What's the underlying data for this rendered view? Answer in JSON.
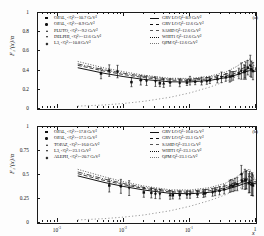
{
  "figure": {
    "xlabel": "x",
    "panel_a_label": "(a)",
    "panel_b_label": "(b)"
  },
  "panel_a": {
    "ylabel": "F₂ʳ(x)/α",
    "yticks": [
      "1",
      "0.8",
      "0.6",
      "0.4",
      "0.2",
      "0"
    ],
    "ylim": [
      0,
      1
    ],
    "xticks": [
      "10",
      "10",
      "10",
      "1"
    ],
    "xtick_exponents": [
      "-3",
      "-2",
      "-1",
      ""
    ],
    "legend_left": [
      {
        "marker": "square",
        "label": "OPAL, <Q²>=10.7 GeV²"
      },
      {
        "marker": "circle",
        "label": "OPAL, <Q²>=8.9 GeV²"
      },
      {
        "marker": "triangle-up",
        "label": "PLUTO, <Q²>=9.2 GeV²"
      },
      {
        "marker": "triangle-down",
        "label": "DELPHI, <Q²>=12.6 GeV²"
      },
      {
        "marker": "diamond",
        "label": "L3, <Q²>=10.8 GeV²"
      }
    ],
    "legend_right": [
      {
        "line": "solid",
        "label": "GRV LO Q²=8.9 GeV²"
      },
      {
        "line": "dash",
        "label": "GRV LO Q²=12.6 GeV²"
      },
      {
        "line": "dashdot",
        "label": "SASID Q²=12.6 GeV²"
      },
      {
        "line": "dot",
        "label": "WHIT1 Q²=12.6 GeV²"
      },
      {
        "line": "longdot",
        "label": "QPM Q²=12.6 GeV²"
      }
    ]
  },
  "panel_b": {
    "ylabel": "F₂ʳ(x)/α",
    "yticks": [
      "1",
      "0.75",
      "0.5",
      "0.25",
      "0"
    ],
    "ylim": [
      0,
      1.1
    ],
    "xticks": [
      "10",
      "10",
      "10",
      "1"
    ],
    "xtick_exponents": [
      "-3",
      "-2",
      "-1",
      ""
    ],
    "legend_left": [
      {
        "marker": "square",
        "label": "OPAL, <Q²>=17.8 GeV²"
      },
      {
        "marker": "circle",
        "label": "OPAL, <Q²>=17.5 GeV²"
      },
      {
        "marker": "triangle-up",
        "label": "TOPAZ, <Q²>=16.0 GeV²"
      },
      {
        "marker": "triangle-down",
        "label": "L3, <Q²>=23.1 GeV²"
      },
      {
        "marker": "diamond",
        "label": "ALEPH, <Q²>=20.7 GeV²"
      }
    ],
    "legend_right": [
      {
        "line": "solid",
        "label": "GRV LO Q²=16.0 GeV²"
      },
      {
        "line": "dash",
        "label": "GRV LO Q²=23.1 GeV²"
      },
      {
        "line": "dashdot",
        "label": "SASID Q²=23.1 GeV²"
      },
      {
        "line": "dot",
        "label": "WHIT1 Q²=23.1 GeV²"
      },
      {
        "line": "longdot",
        "label": "QPM Q²=23.1 GeV²"
      }
    ]
  },
  "chart_data": [
    {
      "type": "scatter",
      "panel": "(a)",
      "title": "Photon structure function F2gamma/alpha, low Q2 sample",
      "xlabel": "x",
      "ylabel": "F2^gamma(x)/alpha",
      "xscale": "log",
      "xlim": [
        0.0005,
        1.0
      ],
      "ylim": [
        0.0,
        1.0
      ],
      "yticks": [
        0,
        0.2,
        0.4,
        0.6,
        0.8,
        1.0
      ],
      "grid": false,
      "legend_position": "top",
      "series": [
        {
          "name": "OPAL, <Q2>=10.7 GeV2",
          "marker": "square",
          "x": [
            0.0045,
            0.013,
            0.035,
            0.09,
            0.2,
            0.35,
            0.55,
            0.75,
            0.9
          ],
          "y": [
            0.37,
            0.28,
            0.268,
            0.275,
            0.3,
            0.33,
            0.37,
            0.43,
            0.395
          ],
          "yerr": [
            0.055,
            0.048,
            0.035,
            0.03,
            0.035,
            0.04,
            0.055,
            0.075,
            0.09
          ]
        },
        {
          "name": "OPAL, <Q2>=8.9 GeV2",
          "marker": "circle",
          "x": [
            0.006,
            0.018,
            0.05,
            0.12,
            0.26,
            0.45,
            0.68,
            0.85
          ],
          "y": [
            0.4,
            0.3,
            0.276,
            0.285,
            0.31,
            0.345,
            0.39,
            0.415
          ],
          "yerr": [
            0.06,
            0.05,
            0.038,
            0.032,
            0.038,
            0.045,
            0.065,
            0.085
          ]
        },
        {
          "name": "PLUTO, <Q2>=9.2 GeV2",
          "marker": "triangle-up",
          "x": [
            0.04,
            0.15,
            0.4,
            0.7
          ],
          "y": [
            0.27,
            0.29,
            0.34,
            0.4
          ],
          "yerr": [
            0.045,
            0.04,
            0.06,
            0.09
          ]
        },
        {
          "name": "DELPHI, <Q2>=12.6 GeV2",
          "marker": "triangle-down",
          "x": [
            0.03,
            0.1,
            0.3,
            0.6,
            0.82
          ],
          "y": [
            0.285,
            0.295,
            0.33,
            0.395,
            0.45
          ],
          "yerr": [
            0.05,
            0.045,
            0.055,
            0.085,
            0.11
          ]
        },
        {
          "name": "L3, <Q2>=10.8 GeV2",
          "marker": "diamond",
          "x": [
            0.008,
            0.022,
            0.07,
            0.18,
            0.42,
            0.66
          ],
          "y": [
            0.39,
            0.295,
            0.272,
            0.292,
            0.34,
            0.385
          ],
          "yerr": [
            0.065,
            0.05,
            0.04,
            0.035,
            0.05,
            0.075
          ]
        }
      ],
      "curves": [
        {
          "name": "GRV LO Q2=8.9 GeV2",
          "line": "solid",
          "x": [
            0.002,
            0.005,
            0.01,
            0.02,
            0.05,
            0.1,
            0.2,
            0.35,
            0.5,
            0.65,
            0.8,
            0.92,
            1.0
          ],
          "y": [
            0.43,
            0.372,
            0.337,
            0.308,
            0.283,
            0.282,
            0.298,
            0.327,
            0.355,
            0.382,
            0.4,
            0.392,
            0.395
          ]
        },
        {
          "name": "GRV LO Q2=12.6 GeV2",
          "line": "dash",
          "x": [
            0.002,
            0.005,
            0.01,
            0.02,
            0.05,
            0.1,
            0.2,
            0.35,
            0.5,
            0.65,
            0.8,
            0.92,
            1.0
          ],
          "y": [
            0.455,
            0.395,
            0.358,
            0.327,
            0.3,
            0.298,
            0.315,
            0.345,
            0.375,
            0.403,
            0.423,
            0.412,
            0.412
          ]
        },
        {
          "name": "SASID Q2=12.6 GeV2",
          "line": "dashdot",
          "x": [
            0.002,
            0.005,
            0.01,
            0.02,
            0.05,
            0.1,
            0.2,
            0.35,
            0.5,
            0.65,
            0.8,
            0.92,
            1.0
          ],
          "y": [
            0.47,
            0.408,
            0.372,
            0.34,
            0.312,
            0.31,
            0.33,
            0.362,
            0.395,
            0.428,
            0.455,
            0.43,
            0.42
          ]
        },
        {
          "name": "WHIT1 Q2=12.6 GeV2",
          "line": "dot",
          "x": [
            0.002,
            0.005,
            0.01,
            0.02,
            0.05,
            0.1,
            0.2,
            0.35,
            0.5,
            0.65,
            0.8,
            0.92,
            1.0
          ],
          "y": [
            0.495,
            0.428,
            0.388,
            0.352,
            0.32,
            0.318,
            0.342,
            0.385,
            0.44,
            0.49,
            0.52,
            0.455,
            0.425
          ]
        },
        {
          "name": "QPM Q2=12.6 GeV2",
          "line": "longdot",
          "x": [
            0.002,
            0.005,
            0.01,
            0.02,
            0.05,
            0.1,
            0.2,
            0.35,
            0.5,
            0.65,
            0.8,
            0.92,
            1.0
          ],
          "y": [
            0.03,
            0.042,
            0.058,
            0.08,
            0.122,
            0.168,
            0.228,
            0.288,
            0.335,
            0.375,
            0.408,
            0.42,
            0.4
          ]
        }
      ]
    },
    {
      "type": "scatter",
      "panel": "(b)",
      "title": "Photon structure function F2gamma/alpha, high Q2 sample",
      "xlabel": "x",
      "ylabel": "F2^gamma(x)/alpha",
      "xscale": "log",
      "xlim": [
        0.0005,
        1.0
      ],
      "ylim": [
        0.0,
        1.1
      ],
      "yticks": [
        0,
        0.25,
        0.5,
        0.75,
        1.0
      ],
      "grid": false,
      "legend_position": "top",
      "series": [
        {
          "name": "OPAL, <Q2>=17.8 GeV2",
          "marker": "square",
          "x": [
            0.006,
            0.02,
            0.055,
            0.13,
            0.28,
            0.45,
            0.62,
            0.78,
            0.9
          ],
          "y": [
            0.43,
            0.35,
            0.318,
            0.33,
            0.37,
            0.425,
            0.48,
            0.455,
            0.43
          ],
          "yerr": [
            0.075,
            0.055,
            0.042,
            0.038,
            0.048,
            0.065,
            0.09,
            0.11,
            0.12
          ]
        },
        {
          "name": "OPAL, <Q2>=17.5 GeV2",
          "marker": "circle",
          "x": [
            0.009,
            0.026,
            0.07,
            0.17,
            0.33,
            0.52,
            0.7,
            0.85
          ],
          "y": [
            0.42,
            0.345,
            0.32,
            0.34,
            0.385,
            0.445,
            0.49,
            0.44
          ],
          "yerr": [
            0.08,
            0.058,
            0.045,
            0.04,
            0.052,
            0.075,
            0.1,
            0.125
          ]
        },
        {
          "name": "TOPAZ, <Q2>=16.0 GeV2",
          "marker": "triangle-up",
          "x": [
            0.05,
            0.16,
            0.4,
            0.68
          ],
          "y": [
            0.322,
            0.338,
            0.42,
            0.5
          ],
          "yerr": [
            0.05,
            0.045,
            0.07,
            0.115
          ]
        },
        {
          "name": "L3, <Q2>=23.1 GeV2",
          "marker": "triangle-down",
          "x": [
            0.012,
            0.035,
            0.1,
            0.24,
            0.48,
            0.72,
            0.88
          ],
          "y": [
            0.4,
            0.332,
            0.325,
            0.358,
            0.44,
            0.495,
            0.445
          ],
          "yerr": [
            0.085,
            0.055,
            0.042,
            0.045,
            0.07,
            0.105,
            0.13
          ]
        },
        {
          "name": "ALEPH, <Q2>=20.7 GeV2",
          "marker": "diamond",
          "x": [
            0.03,
            0.09,
            0.22,
            0.42,
            0.6,
            0.8
          ],
          "y": [
            0.335,
            0.326,
            0.352,
            0.43,
            0.56,
            0.47
          ],
          "yerr": [
            0.055,
            0.042,
            0.045,
            0.068,
            0.1,
            0.12
          ]
        }
      ],
      "curves": [
        {
          "name": "GRV LO Q2=16.0 GeV2",
          "line": "solid",
          "x": [
            0.002,
            0.005,
            0.01,
            0.02,
            0.05,
            0.1,
            0.2,
            0.35,
            0.5,
            0.65,
            0.8,
            0.92,
            1.0
          ],
          "y": [
            0.54,
            0.465,
            0.418,
            0.378,
            0.34,
            0.335,
            0.352,
            0.385,
            0.418,
            0.448,
            0.468,
            0.452,
            0.45
          ]
        },
        {
          "name": "GRV LO Q2=23.1 GeV2",
          "line": "dash",
          "x": [
            0.002,
            0.005,
            0.01,
            0.02,
            0.05,
            0.1,
            0.2,
            0.35,
            0.5,
            0.65,
            0.8,
            0.92,
            1.0
          ],
          "y": [
            0.565,
            0.488,
            0.438,
            0.396,
            0.356,
            0.352,
            0.37,
            0.405,
            0.44,
            0.472,
            0.495,
            0.475,
            0.468
          ]
        },
        {
          "name": "SASID Q2=23.1 GeV2",
          "line": "dashdot",
          "x": [
            0.002,
            0.005,
            0.01,
            0.02,
            0.05,
            0.1,
            0.2,
            0.35,
            0.5,
            0.65,
            0.8,
            0.92,
            1.0
          ],
          "y": [
            0.585,
            0.505,
            0.452,
            0.408,
            0.368,
            0.365,
            0.388,
            0.425,
            0.468,
            0.508,
            0.54,
            0.498,
            0.472
          ]
        },
        {
          "name": "WHIT1 Q2=23.1 GeV2",
          "line": "dot",
          "x": [
            0.002,
            0.005,
            0.01,
            0.02,
            0.05,
            0.1,
            0.2,
            0.35,
            0.5,
            0.65,
            0.8,
            0.92,
            1.0
          ],
          "y": [
            0.615,
            0.53,
            0.472,
            0.424,
            0.38,
            0.378,
            0.405,
            0.458,
            0.525,
            0.585,
            0.618,
            0.53,
            0.478
          ]
        },
        {
          "name": "QPM Q2=23.1 GeV2",
          "line": "longdot",
          "x": [
            0.002,
            0.005,
            0.01,
            0.02,
            0.05,
            0.1,
            0.2,
            0.35,
            0.5,
            0.65,
            0.8,
            0.92,
            1.0
          ],
          "y": [
            0.035,
            0.05,
            0.068,
            0.092,
            0.14,
            0.192,
            0.258,
            0.325,
            0.378,
            0.42,
            0.452,
            0.462,
            0.448
          ]
        }
      ]
    }
  ]
}
